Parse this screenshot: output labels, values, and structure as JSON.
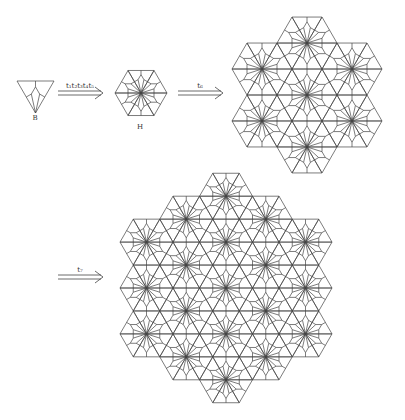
{
  "figure": {
    "stroke_color": "#444444",
    "background": "#ffffff"
  },
  "prototile_B": {
    "label": "B",
    "label_pos": [
      35,
      118
    ],
    "top_left": [
      17,
      81
    ],
    "top_right": [
      54,
      81
    ],
    "apex": [
      35.5,
      113
    ]
  },
  "supertile_H": {
    "label": "H",
    "label_pos": [
      140,
      127
    ],
    "center": [
      141,
      93
    ],
    "side": 26,
    "hex_centers": [
      [
        0,
        0
      ]
    ]
  },
  "cluster_1": {
    "center": [
      307,
      95
    ],
    "side": 30,
    "hex_centers_axial": [
      [
        0,
        0
      ],
      [
        1,
        0
      ],
      [
        -1,
        0
      ],
      [
        0,
        1
      ],
      [
        0,
        -1
      ],
      [
        1,
        -1
      ],
      [
        -1,
        1
      ]
    ]
  },
  "cluster_2": {
    "center": [
      226,
      288
    ],
    "side": 26.5,
    "radius": 2
  },
  "arrows": [
    {
      "label": "t₁t₂t₃t₄t₅",
      "x1": 58,
      "x2": 103,
      "y": 93,
      "label_pos": [
        80,
        86
      ]
    },
    {
      "label": "t₆",
      "x1": 178,
      "x2": 223,
      "y": 93,
      "label_pos": [
        200,
        86
      ]
    },
    {
      "label": "t₇",
      "x1": 58,
      "x2": 103,
      "y": 277,
      "label_pos": [
        80,
        270
      ]
    }
  ]
}
